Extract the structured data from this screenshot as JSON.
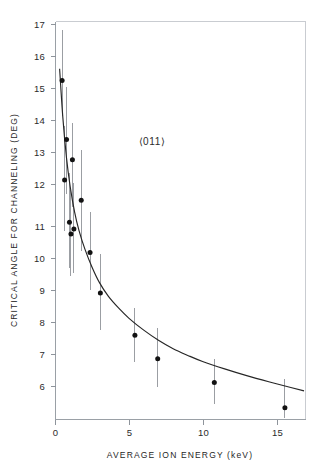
{
  "chart_data": {
    "type": "scatter",
    "title": "",
    "xlabel": "AVERAGE ION ENERGY (keV)",
    "ylabel": "CRITICAL ANGLE FOR CHANNELING (DEG)",
    "annotation": "⟨011⟩",
    "xlim": [
      0,
      17
    ],
    "ylim": [
      5.6,
      17.4
    ],
    "xticks": [
      0,
      5,
      10,
      15
    ],
    "xticklabels": [
      "0",
      "5",
      "10",
      "15"
    ],
    "yticks": [
      6,
      7,
      8,
      9,
      10,
      11,
      12,
      13,
      14,
      15,
      16,
      17
    ],
    "yticklabels": [
      "6",
      "7",
      "8",
      "9",
      "10",
      "11",
      "12",
      "13",
      "14",
      "15",
      "16",
      "17"
    ],
    "grid": false,
    "legend": false,
    "legend_position": "none",
    "series": [
      {
        "name": "Measured critical angle",
        "marker": "filled-circle",
        "color": "#121212",
        "errorbar_color": "#9b9ea3",
        "points": [
          {
            "x": 0.45,
            "y": 15.65,
            "yerr_low": 14.6,
            "yerr_high": 17.15
          },
          {
            "x": 0.75,
            "y": 13.9,
            "yerr_low": 12.3,
            "yerr_high": 15.45
          },
          {
            "x": 0.62,
            "y": 12.7,
            "yerr_low": 11.2,
            "yerr_high": 14.3
          },
          {
            "x": 1.15,
            "y": 13.3,
            "yerr_low": 11.9,
            "yerr_high": 14.4
          },
          {
            "x": 0.95,
            "y": 11.45,
            "yerr_low": 10.1,
            "yerr_high": 12.9
          },
          {
            "x": 1.25,
            "y": 11.25,
            "yerr_low": 9.95,
            "yerr_high": 12.6
          },
          {
            "x": 1.05,
            "y": 11.1,
            "yerr_low": 9.85,
            "yerr_high": 12.4
          },
          {
            "x": 1.75,
            "y": 12.1,
            "yerr_low": 10.6,
            "yerr_high": 13.6
          },
          {
            "x": 2.35,
            "y": 10.55,
            "yerr_low": 9.45,
            "yerr_high": 11.75
          },
          {
            "x": 3.05,
            "y": 9.35,
            "yerr_low": 8.25,
            "yerr_high": 10.5
          },
          {
            "x": 5.4,
            "y": 8.1,
            "yerr_low": 7.3,
            "yerr_high": 8.9
          },
          {
            "x": 6.95,
            "y": 7.4,
            "yerr_low": 6.55,
            "yerr_high": 8.3
          },
          {
            "x": 10.8,
            "y": 6.7,
            "yerr_low": 6.05,
            "yerr_high": 7.4
          },
          {
            "x": 15.6,
            "y": 5.95,
            "yerr_low": 5.65,
            "yerr_high": 6.8
          }
        ]
      }
    ],
    "fit_curve": {
      "name": "Fitted channeling curve",
      "color": "#262626",
      "x": [
        0.28,
        0.5,
        0.75,
        1.0,
        1.3,
        1.6,
        2.0,
        2.5,
        3.0,
        3.6,
        4.3,
        5.0,
        6.0,
        7.0,
        8.0,
        9.0,
        10.0,
        11.5,
        13.0,
        14.5,
        16.0,
        16.9
      ],
      "y": [
        16.0,
        14.55,
        13.35,
        12.5,
        11.75,
        11.2,
        10.65,
        10.1,
        9.65,
        9.25,
        8.9,
        8.6,
        8.25,
        7.95,
        7.7,
        7.5,
        7.32,
        7.1,
        6.9,
        6.72,
        6.55,
        6.45
      ]
    }
  }
}
